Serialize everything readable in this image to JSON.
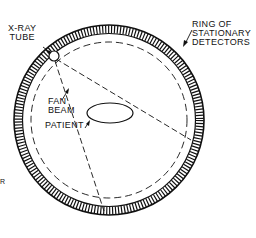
{
  "diagram": {
    "labels": {
      "xray_tube": [
        "X-RAY",
        "TUBE"
      ],
      "ring": [
        "RING OF",
        "STATIONARY",
        "DETECTORS"
      ],
      "fan_beam": [
        "FAN",
        "BEAM"
      ],
      "patient": "PATIENT",
      "stray": "R"
    },
    "colors": {
      "ink": "#111111",
      "background": "#ffffff"
    }
  }
}
